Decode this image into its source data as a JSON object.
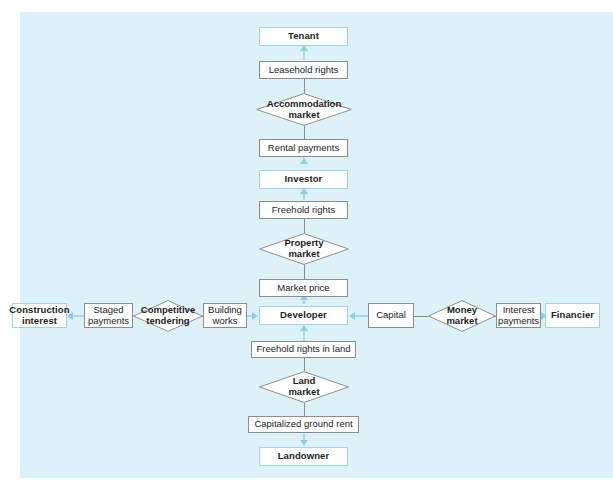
{
  "diagram": {
    "canvas_color": "#ddf2f8",
    "actor_border_color": "#9fd4e8",
    "flow_border_color": "#8c8c8c",
    "arrow_color": "#8fcde4",
    "nodes": {
      "tenant": "Tenant",
      "leasehold_rights": "Leasehold rights",
      "accommodation_market": "Accommodation\nmarket",
      "rental_payments": "Rental payments",
      "investor": "Investor",
      "freehold_rights": "Freehold rights",
      "property_market": "Property\nmarket",
      "market_price": "Market price",
      "developer": "Developer",
      "freehold_rights_in_land": "Freehold rights in land",
      "land_market": "Land\nmarket",
      "capitalized_ground_rent": "Capitalized ground rent",
      "landowner": "Landowner",
      "construction_interest": "Construction\ninterest",
      "staged_payments": "Staged\npayments",
      "competitive_tendering": "Competitive\ntendering",
      "building_works": "Building\nworks",
      "capital": "Capital",
      "money_market": "Money\nmarket",
      "interest_payments": "Interest\npayments",
      "financier": "Financier"
    }
  }
}
